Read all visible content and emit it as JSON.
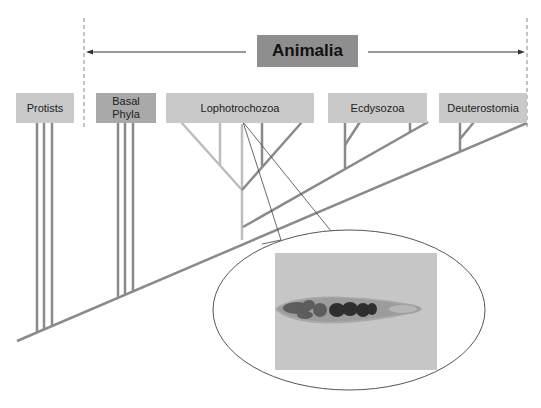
{
  "diagram": {
    "title": "Animalia",
    "groups": [
      {
        "id": "protists",
        "label": "Protists"
      },
      {
        "id": "basal-phyla",
        "label": "Basal\nPhyla"
      },
      {
        "id": "lophotrochozoa",
        "label": "Lophotrochozoa"
      },
      {
        "id": "ecdysozoa",
        "label": "Ecdysozoa"
      },
      {
        "id": "deuterostomia",
        "label": "Deuterostomia"
      }
    ],
    "callout": {
      "target": "Lophotrochozoa",
      "image_subject": "flatworm (fluke) specimen photograph"
    },
    "colors": {
      "branch": "#8a8a8a",
      "branch_light": "#bdbdbd",
      "group_box": "#c9c9c9",
      "basal_box": "#a9a9a9",
      "title_box": "#8e8e8e",
      "arrow": "#333333",
      "dashed_boundary": "#888888"
    }
  }
}
